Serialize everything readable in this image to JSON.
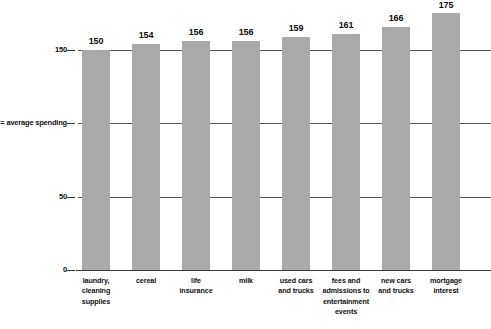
{
  "chart_data": {
    "type": "bar",
    "title": "",
    "subtitle": "",
    "xlabel": "",
    "ylabel": "",
    "ylim": [
      0,
      175
    ],
    "grid": true,
    "legend": null,
    "categories": [
      "laundry, cleaning supplies",
      "cereal",
      "life insurance",
      "milk",
      "used cars and trucks",
      "fees and admissions to entertainment events",
      "new cars and trucks",
      "mortgage interest"
    ],
    "category_lines": [
      [
        "laundry,",
        "cleaning",
        "supplies"
      ],
      [
        "cereal"
      ],
      [
        "life",
        "insurance"
      ],
      [
        "milk"
      ],
      [
        "used cars",
        "and trucks"
      ],
      [
        "fees and",
        "admissions to",
        "entertainment",
        "events"
      ],
      [
        "new cars",
        "and trucks"
      ],
      [
        "mortgage",
        "interest"
      ]
    ],
    "values": [
      150,
      154,
      156,
      156,
      159,
      161,
      166,
      175
    ],
    "value_labels": [
      "150",
      "154",
      "156",
      "156",
      "159",
      "161",
      "166",
      "175"
    ],
    "y_ticks": [
      0,
      50,
      100,
      150
    ],
    "y_tick_labels": [
      "0",
      "50",
      "100 = average spending",
      "150"
    ],
    "series_color": "#a9a9a9",
    "grid_color": "#555555",
    "axis_color": "#3a3a3a",
    "text_color": "#111111"
  }
}
